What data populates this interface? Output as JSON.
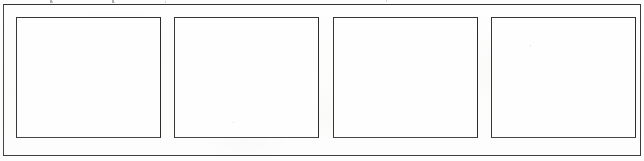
{
  "document": {
    "kind": "scanned-form-fragment",
    "page_background": "#fdfdfc",
    "ink_color": "#3a3a3a",
    "width_px": 644,
    "height_px": 161
  },
  "frame": {
    "name": "outer-border",
    "border_color": "#3d3d3d",
    "fill": "transparent"
  },
  "boxes": {
    "count": 4,
    "fill": "#fefefe",
    "border_color": "#3a3a3a",
    "items": [
      {
        "index": "1",
        "content": ""
      },
      {
        "index": "2",
        "content": ""
      },
      {
        "index": "3",
        "content": ""
      },
      {
        "index": "4",
        "content": ""
      }
    ]
  },
  "artifacts": {
    "speckles": [
      {
        "id": "a"
      },
      {
        "id": "b"
      },
      {
        "id": "c"
      },
      {
        "id": "d"
      },
      {
        "id": "e"
      },
      {
        "id": "f"
      },
      {
        "id": "g"
      },
      {
        "id": "h"
      }
    ]
  }
}
